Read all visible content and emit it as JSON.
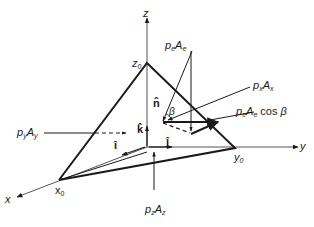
{
  "diagram": {
    "axes": {
      "x_label": "x",
      "y_label": "y",
      "z_label": "z"
    },
    "intercepts": {
      "x0": {
        "base": "x",
        "sub": "0"
      },
      "y0": {
        "base": "y",
        "sub": "0"
      },
      "z0": {
        "base": "z",
        "sub": "0"
      }
    },
    "unit_vectors": {
      "i_hat": "î",
      "j_hat": "ĵ",
      "k_hat": "k̂",
      "n_hat": "n̂"
    },
    "angle_label": "β",
    "forces": {
      "pe_Ae": {
        "p": "p",
        "p_sub": "e",
        "A": "A",
        "A_sub": "e"
      },
      "px_Ax": {
        "p": "p",
        "p_sub": "x",
        "A": "A",
        "A_sub": "x"
      },
      "py_Ay": {
        "p": "p",
        "p_sub": "y",
        "A": "A",
        "A_sub": "y"
      },
      "pz_Az": {
        "p": "p",
        "p_sub": "z",
        "A": "A",
        "A_sub": "z"
      },
      "pe_Ae_cos_beta": {
        "p": "p",
        "p_sub": "e",
        "A": "A",
        "A_sub": "e",
        "suffix": " cos ",
        "angle": "β"
      }
    },
    "colors": {
      "line": "#1a1a1a",
      "background": "#ffffff"
    }
  }
}
